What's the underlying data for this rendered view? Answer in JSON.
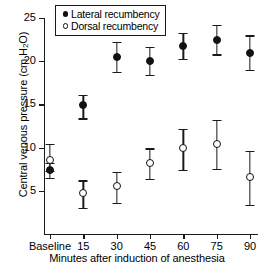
{
  "chart_data": {
    "type": "scatter",
    "title": "",
    "xlabel": "Minutes after induction of anesthesia",
    "ylabel": "Central venous pressure (cm H2O)",
    "ylabel_prefix": "Central venous pressure (cm H",
    "ylabel_sub": "2",
    "ylabel_suffix": "O)",
    "categories": [
      "Baseline",
      "15",
      "30",
      "45",
      "60",
      "75",
      "90"
    ],
    "ylim": [
      0,
      25
    ],
    "yticks": [
      5,
      10,
      15,
      20,
      25
    ],
    "ytick_labels": [
      "5",
      "10",
      "15",
      "20",
      "25"
    ],
    "grid": false,
    "legend_position": "top-left",
    "series": [
      {
        "name": "Lateral recumbency",
        "marker": "filled-circle",
        "color": "#111111",
        "values": [
          7.4,
          14.9,
          20.5,
          20.0,
          21.8,
          22.5,
          21.0
        ],
        "err_low": [
          6.5,
          13.4,
          18.8,
          18.4,
          20.3,
          20.8,
          19.0
        ],
        "err_high": [
          8.2,
          16.1,
          22.2,
          21.7,
          23.3,
          24.2,
          23.0
        ]
      },
      {
        "name": "Dorsal recumbency",
        "marker": "open-circle",
        "color": "#111111",
        "values": [
          8.6,
          4.7,
          5.5,
          8.2,
          9.9,
          10.4,
          6.6
        ],
        "err_low": [
          7.3,
          3.0,
          3.6,
          6.4,
          7.4,
          7.5,
          3.4
        ],
        "err_high": [
          10.4,
          6.2,
          7.2,
          9.9,
          12.2,
          13.2,
          9.6
        ]
      }
    ]
  }
}
